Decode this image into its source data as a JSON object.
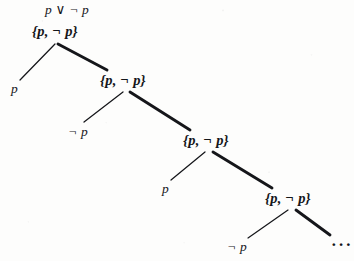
{
  "figure": {
    "kind": "derivation-tree",
    "root_formula": "p ∨ ¬ p",
    "ink_color": "#15161a",
    "background_color": "#fdfdfc",
    "continuation_mark": "···"
  },
  "nodes": [
    {
      "id": "n1",
      "label": "{p, ¬ p}",
      "x": 32,
      "y": 24
    },
    {
      "id": "n2",
      "label": "{p, ¬ p}",
      "x": 100,
      "y": 73
    },
    {
      "id": "n3",
      "label": "{p, ¬ p}",
      "x": 183,
      "y": 133
    },
    {
      "id": "n4",
      "label": "{p, ¬ p}",
      "x": 265,
      "y": 191
    }
  ],
  "leaves": [
    {
      "id": "l1",
      "label": "p",
      "x": 11,
      "y": 82
    },
    {
      "id": "l2",
      "label": "¬ p",
      "x": 68,
      "y": 125
    },
    {
      "id": "l3",
      "label": "p",
      "x": 162,
      "y": 182
    },
    {
      "id": "l4",
      "label": "¬ p",
      "x": 227,
      "y": 240
    }
  ],
  "edges": [
    {
      "id": "e1",
      "from": "n1",
      "to": "l1",
      "x1": 55,
      "y1": 44,
      "x2": 20,
      "y2": 80,
      "weight": "thin"
    },
    {
      "id": "e2",
      "from": "n1",
      "to": "n2",
      "x1": 58,
      "y1": 44,
      "x2": 107,
      "y2": 70,
      "weight": "thick"
    },
    {
      "id": "e3",
      "from": "n2",
      "to": "l2",
      "x1": 123,
      "y1": 92,
      "x2": 84,
      "y2": 122,
      "weight": "thin"
    },
    {
      "id": "e4",
      "from": "n2",
      "to": "n3",
      "x1": 130,
      "y1": 92,
      "x2": 190,
      "y2": 130,
      "weight": "thick"
    },
    {
      "id": "e5",
      "from": "n3",
      "to": "l3",
      "x1": 205,
      "y1": 152,
      "x2": 171,
      "y2": 180,
      "weight": "thin"
    },
    {
      "id": "e6",
      "from": "n3",
      "to": "n4",
      "x1": 213,
      "y1": 152,
      "x2": 272,
      "y2": 188,
      "weight": "thick"
    },
    {
      "id": "e7",
      "from": "n4",
      "to": "l4",
      "x1": 288,
      "y1": 210,
      "x2": 248,
      "y2": 238,
      "weight": "thin"
    },
    {
      "id": "e8",
      "from": "n4",
      "to": "cont",
      "x1": 296,
      "y1": 210,
      "x2": 330,
      "y2": 235,
      "weight": "thick"
    }
  ],
  "root_formula_pos": {
    "x": 45,
    "y": 3
  },
  "continuation_pos": {
    "x": 331,
    "y": 236
  }
}
